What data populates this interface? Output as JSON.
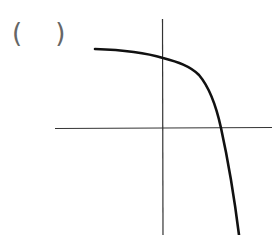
{
  "question": {
    "answer_blank": "(    )"
  },
  "figure": {
    "type": "function-graph",
    "axes": {
      "color": "#333333",
      "x_axis": {
        "x1": 55,
        "y1": 128.5,
        "x2": 272,
        "y2": 127.5
      },
      "y_axis": {
        "x1": 162.5,
        "y1": 19,
        "x2": 163,
        "y2": 235
      }
    },
    "curve": {
      "color": "#111111",
      "stroke_width": 2.6,
      "path": "M95,49 C125,50 150,54 163,58 C178,62 190,66 199,75 C210,88 216,105 221,128 C228,160 234,195 239,235"
    }
  }
}
